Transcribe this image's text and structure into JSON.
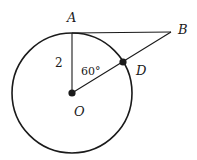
{
  "diagram": {
    "type": "geometry",
    "colors": {
      "stroke": "#1a1a1a",
      "background": "#ffffff"
    },
    "circle": {
      "center_label": "O",
      "cx": 72,
      "cy": 93,
      "r": 60
    },
    "points": {
      "A": {
        "label": "A",
        "x": 72,
        "y": 33
      },
      "B": {
        "label": "B",
        "x": 171,
        "y": 32
      },
      "D": {
        "label": "D",
        "x": 123,
        "y": 62
      },
      "O": {
        "label": "O",
        "x": 72,
        "y": 93
      }
    },
    "segments": [
      {
        "name": "OA",
        "from": "O",
        "to": "A"
      },
      {
        "name": "AB",
        "from": "A",
        "to": "B"
      },
      {
        "name": "OB",
        "from": "O",
        "to": "B"
      }
    ],
    "annotations": {
      "radius_label": "2",
      "angle_label": "60°"
    }
  }
}
